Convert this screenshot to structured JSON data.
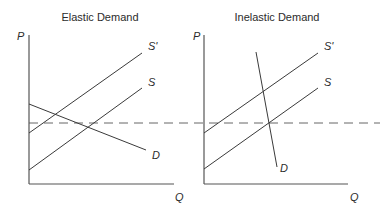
{
  "panels": [
    {
      "title": "Elastic Demand",
      "axes": {
        "y_label": "P",
        "x_label": "Q"
      },
      "curves": [
        {
          "name": "S'",
          "label": "S'"
        },
        {
          "name": "S",
          "label": "S"
        },
        {
          "name": "D",
          "label": "D"
        }
      ]
    },
    {
      "title": "Inelastic Demand",
      "axes": {
        "y_label": "P",
        "x_label": "Q"
      },
      "curves": [
        {
          "name": "S'",
          "label": "S'"
        },
        {
          "name": "S",
          "label": "S"
        },
        {
          "name": "D",
          "label": "D"
        }
      ]
    }
  ],
  "reference_line": {
    "style": "dashed",
    "description": "horizontal price level across both panels"
  }
}
